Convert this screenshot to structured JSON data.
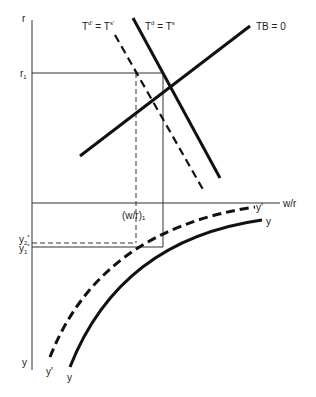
{
  "diagram": {
    "axes": {
      "vertical_top_label": "r",
      "vertical_bottom_label": "y",
      "horizontal_label": "w/r"
    },
    "curves": {
      "tb": {
        "label": "TB = 0"
      },
      "td_ts": {
        "label_main": "T",
        "sup_d": "d",
        "eq": " = T",
        "sup_s": "s"
      },
      "td_ts_prime": {
        "label_main": "T",
        "sup_d": "d'",
        "eq": " = T",
        "sup_s": "s'"
      },
      "y_curve": {
        "label_end": "y",
        "label_start": "y"
      },
      "y_prime_curve": {
        "label_end": "y'",
        "label_start": "y'"
      }
    },
    "markers": {
      "r1": {
        "main": "r",
        "sub": "1"
      },
      "w_r_1": "(w/r)₁",
      "y1_star": {
        "main": "y",
        "sub": "1",
        "sup": "*"
      },
      "y2_star": {
        "main": "y",
        "sub": "2",
        "sup": "*"
      }
    },
    "colors": {
      "line": "#111111",
      "thin": "#333333"
    }
  }
}
